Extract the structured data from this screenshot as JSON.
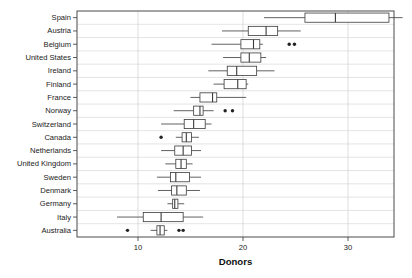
{
  "chart_data": {
    "type": "box",
    "title": "",
    "xlabel": "Donors",
    "ylabel": "",
    "xlim": [
      5.8,
      36.2
    ],
    "grid": true,
    "legend": "none",
    "xticks": [
      10,
      20,
      30
    ],
    "xtick_labels": [
      "10",
      "20",
      "30"
    ],
    "categories": [
      "Spain",
      "Austria",
      "Belgium",
      "United States",
      "Ireland",
      "Finland",
      "France",
      "Norway",
      "Switzerland",
      "Canada",
      "Netherlands",
      "United Kingdom",
      "Sweden",
      "Denmark",
      "Germany",
      "Italy",
      "Australia"
    ],
    "boxes": [
      {
        "category": "Spain",
        "whisker_low": 22.0,
        "q1": 25.9,
        "median": 28.8,
        "q3": 33.9,
        "whisker_high": 35.2,
        "outliers": []
      },
      {
        "category": "Austria",
        "whisker_low": 18.0,
        "q1": 20.5,
        "median": 22.2,
        "q3": 23.3,
        "whisker_high": 25.5,
        "outliers": []
      },
      {
        "category": "Belgium",
        "whisker_low": 17.0,
        "q1": 19.8,
        "median": 21.0,
        "q3": 21.6,
        "whisker_high": 21.9,
        "outliers": [
          24.4,
          24.9
        ]
      },
      {
        "category": "United States",
        "whisker_low": 18.1,
        "q1": 19.8,
        "median": 20.6,
        "q3": 21.7,
        "whisker_high": 22.2,
        "outliers": []
      },
      {
        "category": "Ireland",
        "whisker_low": 16.7,
        "q1": 18.5,
        "median": 19.4,
        "q3": 21.3,
        "whisker_high": 23.0,
        "outliers": []
      },
      {
        "category": "Finland",
        "whisker_low": 17.2,
        "q1": 18.2,
        "median": 19.5,
        "q3": 20.3,
        "whisker_high": 20.5,
        "outliers": []
      },
      {
        "category": "France",
        "whisker_low": 15.0,
        "q1": 15.9,
        "median": 17.1,
        "q3": 17.5,
        "whisker_high": 20.3,
        "outliers": []
      },
      {
        "category": "Norway",
        "whisker_low": 13.4,
        "q1": 15.3,
        "median": 15.9,
        "q3": 16.2,
        "whisker_high": 17.2,
        "outliers": [
          18.3,
          19.0
        ]
      },
      {
        "category": "Switzerland",
        "whisker_low": 12.2,
        "q1": 14.4,
        "median": 15.3,
        "q3": 16.4,
        "whisker_high": 17.0,
        "outliers": []
      },
      {
        "category": "Canada",
        "whisker_low": 13.6,
        "q1": 14.2,
        "median": 14.6,
        "q3": 15.1,
        "whisker_high": 15.8,
        "outliers": [
          12.2
        ]
      },
      {
        "category": "Netherlands",
        "whisker_low": 12.2,
        "q1": 13.5,
        "median": 14.3,
        "q3": 15.1,
        "whisker_high": 16.0,
        "outliers": []
      },
      {
        "category": "United Kingdom",
        "whisker_low": 12.6,
        "q1": 13.6,
        "median": 14.1,
        "q3": 14.6,
        "whisker_high": 15.2,
        "outliers": []
      },
      {
        "category": "Sweden",
        "whisker_low": 11.8,
        "q1": 13.1,
        "median": 13.6,
        "q3": 14.9,
        "whisker_high": 16.0,
        "outliers": []
      },
      {
        "category": "Denmark",
        "whisker_low": 11.9,
        "q1": 13.2,
        "median": 13.7,
        "q3": 14.6,
        "whisker_high": 15.9,
        "outliers": []
      },
      {
        "category": "Germany",
        "whisker_low": 12.8,
        "q1": 13.3,
        "median": 13.5,
        "q3": 13.8,
        "whisker_high": 14.4,
        "outliers": []
      },
      {
        "category": "Italy",
        "whisker_low": 8.0,
        "q1": 10.5,
        "median": 12.2,
        "q3": 14.3,
        "whisker_high": 16.2,
        "outliers": []
      },
      {
        "category": "Australia",
        "whisker_low": 11.2,
        "q1": 11.8,
        "median": 12.1,
        "q3": 12.5,
        "whisker_high": 12.8,
        "outliers": [
          9.0,
          13.9,
          14.3
        ]
      }
    ]
  },
  "colors": {
    "frame": "#4a4a4a",
    "grid": "#d8d8d8",
    "box": "#3a3a3a",
    "outlier": "#222222",
    "background": "#ffffff"
  }
}
